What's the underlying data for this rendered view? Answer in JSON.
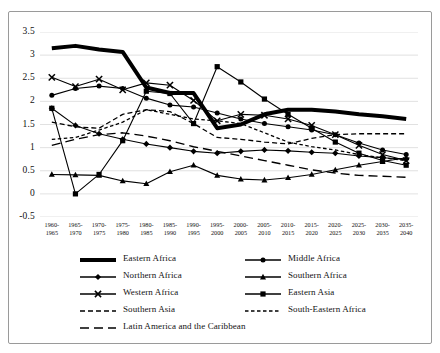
{
  "chart_data": {
    "type": "line",
    "title": "",
    "xlabel": "",
    "ylabel": "",
    "ylim": [
      -0.5,
      3.5
    ],
    "yticks": [
      3.5,
      3,
      2.5,
      2,
      1.5,
      1,
      0.5,
      0,
      -0.5
    ],
    "ytick_labels": [
      "3.5",
      "3",
      "2.5",
      "2",
      "1.5",
      "1",
      "0.5",
      "0",
      "-0.5"
    ],
    "grid": true,
    "legend_position": "below",
    "categories": [
      "1960-\n1965",
      "1965-\n1970",
      "1970-\n1975",
      "1975-\n1980",
      "1980-\n1985",
      "1985-\n1990",
      "1990-\n1995",
      "1995-\n2000",
      "2000-\n2005",
      "2005-\n2010",
      "2010-\n2015",
      "2015-\n2020",
      "2020-\n2025",
      "2025-\n2030",
      "2030-\n2035",
      "2035-\n2040"
    ],
    "category_top": [
      "1960-",
      "1965-",
      "1970-",
      "1975-",
      "1980-",
      "1985-",
      "1990-",
      "1995-",
      "2000-",
      "2005-",
      "2010-",
      "2015-",
      "2020-",
      "2025-",
      "2030-",
      "2035-"
    ],
    "category_bottom": [
      "1965",
      "1970",
      "1975",
      "1980",
      "1985",
      "1990",
      "1995",
      "2000",
      "2005",
      "2010",
      "2015",
      "2020",
      "2025",
      "2030",
      "2035",
      "2040"
    ],
    "series": [
      {
        "name": "Eastern Africa",
        "marker": "none",
        "dash": "solid",
        "width": 4.0,
        "values": [
          3.15,
          3.2,
          3.12,
          3.07,
          2.3,
          2.18,
          2.18,
          1.42,
          1.5,
          1.72,
          1.82,
          1.82,
          1.78,
          1.72,
          1.68,
          1.62
        ]
      },
      {
        "name": "Middle Africa",
        "marker": "circle",
        "dash": "solid",
        "width": 1.1,
        "values": [
          2.13,
          2.28,
          2.33,
          2.28,
          2.07,
          1.92,
          1.88,
          1.75,
          1.62,
          1.52,
          1.45,
          1.38,
          1.28,
          1.1,
          0.95,
          0.85
        ]
      },
      {
        "name": "Northern Africa",
        "marker": "diamond",
        "dash": "solid",
        "width": 1.1,
        "values": [
          1.85,
          1.48,
          1.3,
          1.18,
          1.08,
          1.0,
          0.92,
          0.88,
          0.92,
          0.95,
          0.93,
          0.9,
          0.88,
          0.82,
          0.78,
          0.75
        ]
      },
      {
        "name": "Southern Africa",
        "marker": "triangle",
        "dash": "solid",
        "width": 1.1,
        "values": [
          0.42,
          0.41,
          0.4,
          0.28,
          0.22,
          0.48,
          0.62,
          0.4,
          0.32,
          0.3,
          0.35,
          0.42,
          0.52,
          0.62,
          0.7,
          0.78
        ]
      },
      {
        "name": "Western Africa",
        "marker": "cross",
        "dash": "solid",
        "width": 1.1,
        "values": [
          2.52,
          2.32,
          2.48,
          2.25,
          2.4,
          2.35,
          2.02,
          1.58,
          1.72,
          1.7,
          1.62,
          1.48,
          1.28,
          1.05,
          0.85,
          0.72
        ]
      },
      {
        "name": "Eastern Asia",
        "marker": "square",
        "dash": "solid",
        "width": 1.1,
        "values": [
          1.85,
          0.0,
          0.42,
          1.15,
          2.22,
          2.17,
          1.52,
          2.75,
          2.42,
          2.05,
          1.72,
          1.42,
          1.12,
          0.88,
          0.72,
          0.62
        ]
      },
      {
        "name": "Southern Asia",
        "marker": "none",
        "dash": "dashed",
        "width": 1.3,
        "values": [
          1.55,
          1.45,
          1.42,
          1.72,
          1.82,
          1.78,
          1.52,
          1.22,
          1.18,
          1.12,
          1.08,
          1.2,
          1.28,
          1.3,
          1.3,
          1.3
        ]
      },
      {
        "name": "South-Eastern Africa",
        "marker": "none",
        "dash": "dotted",
        "width": 1.3,
        "values": [
          1.18,
          1.22,
          1.38,
          1.55,
          1.82,
          1.72,
          1.62,
          1.58,
          1.52,
          1.32,
          1.12,
          1.02,
          0.95,
          0.85,
          0.78,
          0.72
        ]
      },
      {
        "name": "Latin America and the Caribbean",
        "marker": "none",
        "dash": "longdash",
        "width": 1.4,
        "values": [
          1.05,
          1.18,
          1.28,
          1.32,
          1.25,
          1.15,
          1.02,
          0.92,
          0.82,
          0.72,
          0.62,
          0.52,
          0.45,
          0.4,
          0.38,
          0.36
        ]
      }
    ]
  },
  "legend": {
    "items": [
      {
        "label": "Eastern Africa",
        "marker": "none",
        "dash": "solid",
        "width": 4.0
      },
      {
        "label": "Middle Africa",
        "marker": "circle",
        "dash": "solid",
        "width": 1.4
      },
      {
        "label": "Northern Africa",
        "marker": "diamond",
        "dash": "solid",
        "width": 1.4
      },
      {
        "label": "Southern Africa",
        "marker": "triangle",
        "dash": "solid",
        "width": 1.4
      },
      {
        "label": "Western Africa",
        "marker": "cross",
        "dash": "solid",
        "width": 1.4
      },
      {
        "label": "Eastern Asia",
        "marker": "square",
        "dash": "solid",
        "width": 1.4
      },
      {
        "label": "Southern Asia",
        "marker": "none",
        "dash": "dashed",
        "width": 1.6
      },
      {
        "label": "South-Eastern Africa",
        "marker": "none",
        "dash": "dotted",
        "width": 1.6
      },
      {
        "label": "Latin America and the Caribbean",
        "marker": "none",
        "dash": "longdash",
        "width": 1.6
      }
    ]
  },
  "colors": {
    "line": "#000000",
    "grid": "#d9d9d9",
    "frame": "#9a9a9a",
    "text": "#111111",
    "background": "#ffffff"
  }
}
